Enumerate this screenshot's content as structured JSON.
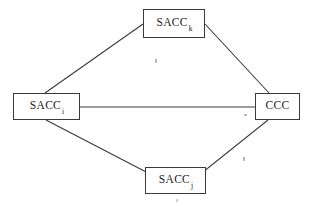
{
  "figure": {
    "background_color": "#ffffff",
    "line_color": "#3a3a3a",
    "text_color": "#1c1c1c",
    "width": 315,
    "height": 206
  },
  "nodes": [
    {
      "id": "sacc-k",
      "label": "SACC",
      "subscript": "k",
      "position": "top",
      "box": {
        "x": 143,
        "y": 9,
        "w": 62,
        "h": 29
      }
    },
    {
      "id": "sacc-i",
      "label": "SACC",
      "subscript": "i",
      "position": "left",
      "box": {
        "x": 13,
        "y": 93,
        "w": 67,
        "h": 27
      }
    },
    {
      "id": "ccc",
      "label": "CCC",
      "subscript": "",
      "position": "right",
      "box": {
        "x": 255,
        "y": 93,
        "w": 45,
        "h": 27
      }
    },
    {
      "id": "sacc-j",
      "label": "SACC",
      "subscript": "j",
      "position": "bottom",
      "box": {
        "x": 145,
        "y": 167,
        "w": 61,
        "h": 27
      }
    }
  ],
  "edges": [
    {
      "id": "edge-sacc-i-sacc-k",
      "from": "sacc-i",
      "to": "sacc-k",
      "x1": 45,
      "y1": 93,
      "x2": 143,
      "y2": 24
    },
    {
      "id": "edge-sacc-k-ccc",
      "from": "sacc-k",
      "to": "ccc",
      "x1": 205,
      "y1": 24,
      "x2": 269,
      "y2": 93
    },
    {
      "id": "edge-sacc-i-ccc",
      "from": "sacc-i",
      "to": "ccc",
      "x1": 80,
      "y1": 107,
      "x2": 255,
      "y2": 107
    },
    {
      "id": "edge-sacc-i-sacc-j",
      "from": "sacc-i",
      "to": "sacc-j",
      "x1": 46,
      "y1": 120,
      "x2": 150,
      "y2": 174
    },
    {
      "id": "edge-sacc-j-ccc",
      "from": "sacc-j",
      "to": "ccc",
      "x1": 203,
      "y1": 172,
      "x2": 268,
      "y2": 120
    }
  ],
  "artifacts": [
    {
      "id": "speck-1",
      "x": 155,
      "y": 59
    },
    {
      "id": "speck-2",
      "x": 244,
      "y": 114
    },
    {
      "id": "speck-3",
      "x": 243,
      "y": 157
    },
    {
      "id": "speck-4",
      "x": 176,
      "y": 199
    }
  ]
}
